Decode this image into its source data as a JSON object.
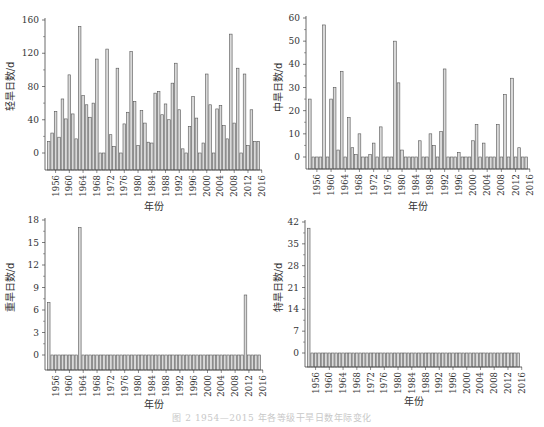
{
  "years": [
    1954,
    1955,
    1956,
    1957,
    1958,
    1959,
    1960,
    1961,
    1962,
    1963,
    1964,
    1965,
    1966,
    1967,
    1968,
    1969,
    1970,
    1971,
    1972,
    1973,
    1974,
    1975,
    1976,
    1977,
    1978,
    1979,
    1980,
    1981,
    1982,
    1983,
    1984,
    1985,
    1986,
    1987,
    1988,
    1989,
    1990,
    1991,
    1992,
    1993,
    1994,
    1995,
    1996,
    1997,
    1998,
    1999,
    2000,
    2001,
    2002,
    2003,
    2004,
    2005,
    2006,
    2007,
    2008,
    2009,
    2010,
    2011,
    2012,
    2013,
    2014,
    2015
  ],
  "colors": {
    "bar_fill": "#d9d9d9",
    "bar_stroke": "#555555",
    "axis": "#444444",
    "text": "#333333"
  },
  "caption": "图 2   1954—2015 年各等级干旱日数年际变化",
  "chart_data": [
    {
      "type": "bar",
      "id": "light",
      "title": "",
      "xlabel": "年份",
      "ylabel": "轻旱日数/d",
      "ylim": [
        -20,
        160
      ],
      "yticks": [
        0,
        40,
        80,
        120,
        160
      ],
      "xtick_labels": [
        "1956",
        "1960",
        "1964",
        "1968",
        "1972",
        "1976",
        "1980",
        "1984",
        "1988",
        "1992",
        "1996",
        "2000",
        "2004",
        "2008",
        "2012",
        "2016"
      ],
      "grid": false,
      "categories_ref": "years",
      "values": [
        14,
        24,
        50,
        19,
        65,
        41,
        94,
        47,
        17,
        152,
        69,
        58,
        43,
        60,
        113,
        0,
        0,
        125,
        22,
        8,
        102,
        0,
        35,
        49,
        122,
        62,
        9,
        51,
        36,
        13,
        12,
        72,
        74,
        46,
        59,
        40,
        84,
        108,
        52,
        5,
        0,
        32,
        68,
        42,
        0,
        12,
        95,
        58,
        0,
        53,
        57,
        33,
        17,
        143,
        36,
        102,
        0,
        95,
        9,
        52,
        14,
        14
      ]
    },
    {
      "type": "bar",
      "id": "moderate",
      "title": "",
      "xlabel": "年份",
      "ylabel": "中旱日数/d",
      "ylim": [
        -5,
        60
      ],
      "yticks": [
        0,
        10,
        20,
        30,
        40,
        50,
        60
      ],
      "xtick_labels": [
        "1956",
        "1960",
        "1964",
        "1968",
        "1972",
        "1976",
        "1980",
        "1984",
        "1988",
        "1992",
        "1996",
        "2000",
        "2004",
        "2008",
        "2012",
        "2016"
      ],
      "grid": false,
      "categories_ref": "years",
      "values": [
        25,
        0,
        0,
        0,
        57,
        0,
        25,
        30,
        3,
        37,
        0,
        17,
        4,
        1,
        10,
        0,
        0,
        1,
        6,
        0,
        13,
        0,
        0,
        0,
        50,
        32,
        3,
        0,
        0,
        0,
        0,
        7,
        0,
        0,
        10,
        5,
        0,
        11,
        38,
        0,
        0,
        0,
        2,
        0,
        0,
        0,
        7,
        14,
        0,
        6,
        0,
        0,
        0,
        14,
        0,
        27,
        0,
        34,
        0,
        4,
        0,
        0
      ]
    },
    {
      "type": "bar",
      "id": "severe",
      "title": "",
      "xlabel": "年份",
      "ylabel": "重旱日数/d",
      "ylim": [
        -3,
        18
      ],
      "yticks": [
        0,
        3,
        6,
        9,
        12,
        15,
        18
      ],
      "xtick_labels": [
        "1956",
        "1960",
        "1964",
        "1968",
        "1972",
        "1976",
        "1980",
        "1984",
        "1988",
        "1992",
        "1996",
        "2000",
        "2004",
        "2008",
        "2012",
        "2016"
      ],
      "grid": false,
      "categories_ref": "years",
      "values": [
        7,
        0,
        0,
        0,
        0,
        0,
        0,
        0,
        0,
        17,
        0,
        0,
        0,
        0,
        0,
        0,
        0,
        0,
        0,
        0,
        0,
        0,
        0,
        0,
        0,
        0,
        0,
        0,
        0,
        0,
        0,
        0,
        0,
        0,
        0,
        0,
        0,
        0,
        0,
        0,
        0,
        0,
        0,
        0,
        0,
        0,
        0,
        0,
        0,
        0,
        0,
        0,
        0,
        0,
        0,
        0,
        0,
        8,
        0,
        0,
        0,
        0
      ]
    },
    {
      "type": "bar",
      "id": "extreme",
      "title": "",
      "xlabel": "年份",
      "ylabel": "特旱日数/d",
      "ylim": [
        -7,
        42
      ],
      "yticks": [
        0,
        7,
        14,
        21,
        28,
        35,
        42
      ],
      "xtick_labels": [
        "1956",
        "1960",
        "1964",
        "1968",
        "1972",
        "1976",
        "1980",
        "1984",
        "1988",
        "1992",
        "1996",
        "2000",
        "2004",
        "2008",
        "2012",
        "2016"
      ],
      "grid": false,
      "categories_ref": "years",
      "values": [
        40,
        0,
        0,
        0,
        0,
        0,
        0,
        0,
        0,
        0,
        0,
        0,
        0,
        0,
        0,
        0,
        0,
        0,
        0,
        0,
        0,
        0,
        0,
        0,
        0,
        0,
        0,
        0,
        0,
        0,
        0,
        0,
        0,
        0,
        0,
        0,
        0,
        0,
        0,
        0,
        0,
        0,
        0,
        0,
        0,
        0,
        0,
        0,
        0,
        0,
        0,
        0,
        0,
        0,
        0,
        0,
        0,
        0,
        0,
        0,
        0,
        0
      ]
    }
  ]
}
